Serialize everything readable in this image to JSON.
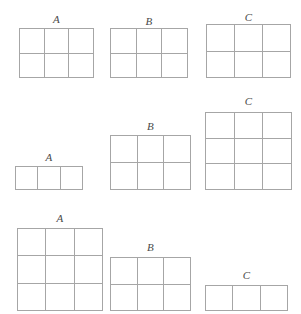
{
  "diagram": {
    "line_color": "#a6a6a6",
    "label_color": "#4a4a4a",
    "background": "#ffffff",
    "rows": [
      {
        "name": "row-1",
        "baseline_y": 78,
        "groups": [
          {
            "label": "A",
            "x": 19,
            "width": 75,
            "height": 50,
            "cols": 3,
            "rows": 2,
            "label_y": 14
          },
          {
            "label": "B",
            "x": 110,
            "width": 78,
            "height": 50,
            "cols": 3,
            "rows": 2,
            "label_y": 16
          },
          {
            "label": "C",
            "x": 206,
            "width": 85,
            "height": 54,
            "cols": 3,
            "rows": 2,
            "label_y": 12
          }
        ]
      },
      {
        "name": "row-2",
        "baseline_y": 190,
        "groups": [
          {
            "label": "A",
            "x": 15,
            "width": 68,
            "height": 24,
            "cols": 3,
            "rows": 1,
            "label_y": 152
          },
          {
            "label": "B",
            "x": 110,
            "width": 81,
            "height": 55,
            "cols": 3,
            "rows": 2,
            "label_y": 121
          },
          {
            "label": "C",
            "x": 205,
            "width": 87,
            "height": 78,
            "cols": 3,
            "rows": 3,
            "label_y": 96
          }
        ]
      },
      {
        "name": "row-3",
        "baseline_y": 311,
        "groups": [
          {
            "label": "A",
            "x": 17,
            "width": 86,
            "height": 83,
            "cols": 3,
            "rows": 3,
            "label_y": 213
          },
          {
            "label": "B",
            "x": 110,
            "width": 81,
            "height": 54,
            "cols": 3,
            "rows": 2,
            "label_y": 242
          },
          {
            "label": "C",
            "x": 205,
            "width": 83,
            "height": 26,
            "cols": 3,
            "rows": 1,
            "label_y": 270
          }
        ]
      }
    ]
  }
}
